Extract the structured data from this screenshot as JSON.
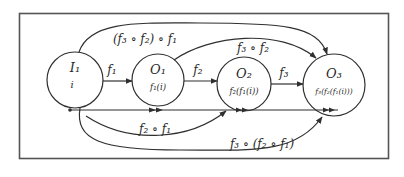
{
  "diagram": {
    "colors": {
      "stroke": "#2f2f2f",
      "frame": "#555555",
      "text": "#2a2a2a",
      "background": "#ffffff"
    },
    "nodes": [
      {
        "id": "I1",
        "title": "I₁",
        "value": "i"
      },
      {
        "id": "O1",
        "title": "O₁",
        "value": "f₁(i)"
      },
      {
        "id": "O2",
        "title": "O₂",
        "value": "f₂(f₁(i))"
      },
      {
        "id": "O3",
        "title": "O₃",
        "value": "f₃(f₂(f₁(i)))"
      }
    ],
    "edges": [
      {
        "from": "I1",
        "to": "O1",
        "label": "f₁"
      },
      {
        "from": "O1",
        "to": "O2",
        "label": "f₂"
      },
      {
        "from": "O2",
        "to": "O3",
        "label": "f₃"
      },
      {
        "from": "I1",
        "to": "O2",
        "label": "f₂ ∘ f₁"
      },
      {
        "from": "O1",
        "to": "O3",
        "label": "f₃ ∘ f₂"
      },
      {
        "from": "I1",
        "to": "O3",
        "label": "(f₃ ∘ f₂) ∘ f₁",
        "position": "top"
      },
      {
        "from": "I1",
        "to": "O3",
        "label": "f₃ ∘ (f₂ ∘ f₁)",
        "position": "bottom"
      }
    ]
  }
}
